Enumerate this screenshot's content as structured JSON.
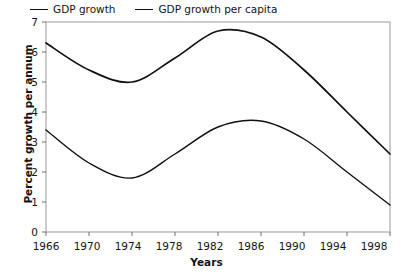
{
  "chart_data": {
    "type": "line",
    "title": "",
    "xlabel": "Years",
    "ylabel": "Percent growth per annum",
    "xlim": [
      1966,
      1998
    ],
    "ylim": [
      0,
      7
    ],
    "grid": false,
    "legend_position": "top-left",
    "xticks": [
      1966,
      1970,
      1974,
      1978,
      1982,
      1986,
      1990,
      1994,
      1998
    ],
    "yticks": [
      0,
      1,
      2,
      3,
      4,
      5,
      6,
      7
    ],
    "x": [
      1966,
      1970,
      1974,
      1978,
      1982,
      1986,
      1990,
      1994,
      1998
    ],
    "series": [
      {
        "name": "GDP growth",
        "color": "#111111",
        "values": [
          6.3,
          5.4,
          5.0,
          5.8,
          6.7,
          6.5,
          5.4,
          4.0,
          2.6
        ]
      },
      {
        "name": "GDP growth per capita",
        "color": "#111111",
        "values": [
          3.4,
          2.3,
          1.8,
          2.6,
          3.5,
          3.7,
          3.1,
          2.0,
          0.9
        ]
      }
    ]
  },
  "legend": {
    "entries": [
      {
        "label": "GDP growth"
      },
      {
        "label": "GDP growth per capita"
      }
    ]
  },
  "axes": {
    "y_title": "Percent growth per annum",
    "x_title": "Years",
    "y_ticks": [
      "7",
      "6",
      "5",
      "4",
      "3",
      "2",
      "1",
      "0"
    ],
    "x_ticks": [
      "1966",
      "1970",
      "1974",
      "1978",
      "1982",
      "1986",
      "1990",
      "1994",
      "1998"
    ]
  },
  "colors": {
    "line": "#111111",
    "frame": "#9a9a9a",
    "text": "#141414",
    "background": "#ffffff"
  }
}
